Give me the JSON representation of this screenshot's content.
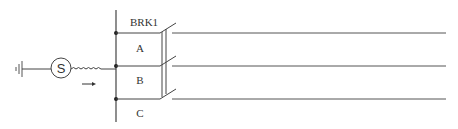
{
  "diagram": {
    "breaker_label": "BRK1",
    "phases": [
      "A",
      "B",
      "C"
    ],
    "source_symbol": "S",
    "colors": {
      "line": "#444444",
      "background": "#ffffff"
    }
  }
}
